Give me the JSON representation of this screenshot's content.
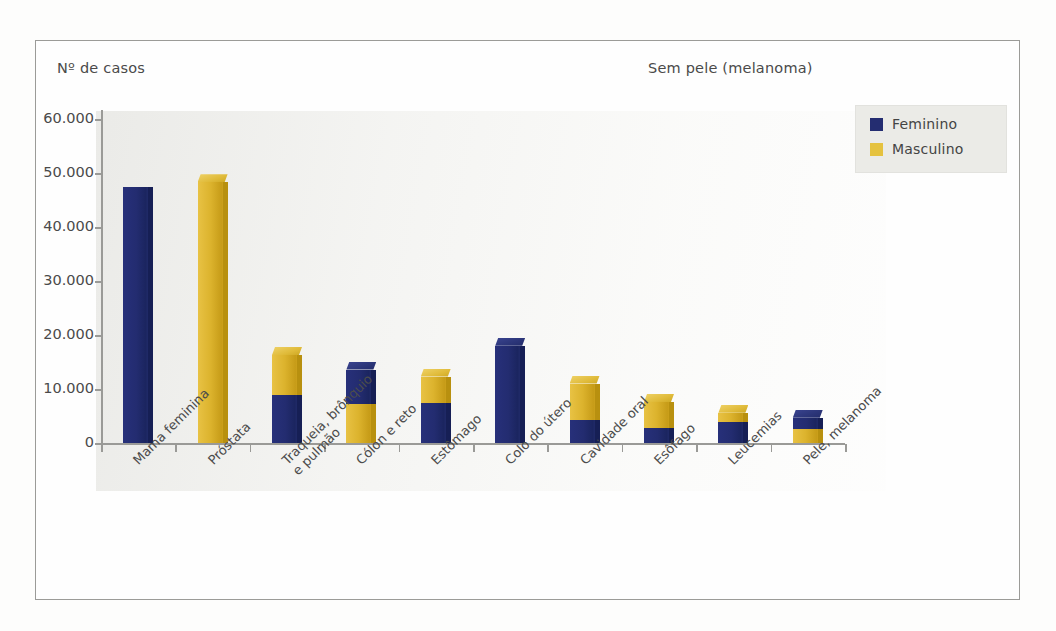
{
  "figure": {
    "y_axis_title": "Nº de casos",
    "note": "Sem pele (melanoma)"
  },
  "legend": {
    "items": [
      {
        "label": "Feminino",
        "color": "#242d71",
        "icon": "square-swatch-icon"
      },
      {
        "label": "Masculino",
        "color": "#e5c23f",
        "icon": "square-swatch-icon"
      }
    ]
  },
  "chart_data": {
    "type": "bar",
    "stacked": true,
    "title": "",
    "subtitle": "",
    "annotations": [
      "Sem pele (melanoma)"
    ],
    "xlabel": "",
    "ylabel": "Nº de casos",
    "ylim": [
      0,
      60000
    ],
    "ytick_labels": [
      "60.000",
      "50.000",
      "40.000",
      "30.000",
      "20.000",
      "10.000",
      "0"
    ],
    "ytick_values": [
      60000,
      50000,
      40000,
      30000,
      20000,
      10000,
      0
    ],
    "grid": false,
    "legend_position": "right-top",
    "categories": [
      "Mama feminina",
      "Próstata",
      "Traqueia, brônquio e pulmão",
      "Cólon e reto",
      "Estômago",
      "Colo do útero",
      "Cavidade oral",
      "Esôfago",
      "Leucemias",
      "Pele, melanoma"
    ],
    "category_lines": [
      [
        "Mama feminina"
      ],
      [
        "Próstata"
      ],
      [
        "Traqueia, brônquio",
        "e pulmão"
      ],
      [
        "Cólon e reto"
      ],
      [
        "Estômago"
      ],
      [
        "Colo do útero"
      ],
      [
        "Cavidade oral"
      ],
      [
        "Esôfago"
      ],
      [
        "Leucemias"
      ],
      [
        "Pele, melanoma"
      ]
    ],
    "series": [
      {
        "name": "Feminino",
        "color": "#242d71",
        "values": [
          47500,
          0,
          8900,
          6300,
          7400,
          18000,
          4200,
          2700,
          3900,
          2100
        ]
      },
      {
        "name": "Masculino",
        "color": "#e5c23f",
        "values": [
          0,
          48300,
          7400,
          7300,
          4900,
          0,
          6800,
          4900,
          1700,
          2600
        ]
      }
    ],
    "stack_order": [
      [
        "Feminino",
        "Masculino"
      ],
      [
        "Masculino"
      ],
      [
        "Feminino",
        "Masculino"
      ],
      [
        "Masculino",
        "Feminino"
      ],
      [
        "Feminino",
        "Masculino"
      ],
      [
        "Feminino"
      ],
      [
        "Feminino",
        "Masculino"
      ],
      [
        "Feminino",
        "Masculino"
      ],
      [
        "Feminino",
        "Masculino"
      ],
      [
        "Masculino",
        "Feminino"
      ]
    ],
    "totals": [
      47500,
      48300,
      16300,
      13600,
      12300,
      18000,
      11000,
      7600,
      5600,
      4700
    ]
  }
}
